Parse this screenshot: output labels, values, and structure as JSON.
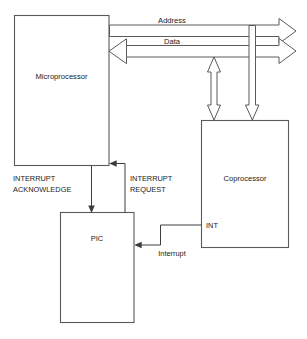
{
  "diagram": {
    "colors": {
      "background": "#ffffff",
      "box_stroke": "#5a5a5a",
      "line_stroke": "#3d3d3d",
      "text": "#1a1a1a"
    },
    "blocks": [
      {
        "id": "microprocessor",
        "label": "Microprocessor"
      },
      {
        "id": "coprocessor",
        "label": "Coprocessor"
      },
      {
        "id": "pic",
        "label": "PIC"
      }
    ],
    "buses": [
      {
        "id": "address-bus",
        "label": "Address",
        "direction": "out"
      },
      {
        "id": "data-bus",
        "label": "Data",
        "direction": "in"
      }
    ],
    "signals": [
      {
        "id": "interrupt-acknowledge",
        "label_line1": "INTERRUPT",
        "label_line2": "ACKNOWLEDGE"
      },
      {
        "id": "interrupt-request",
        "label_line1": "INTERRUPT",
        "label_line2": "REQUEST"
      },
      {
        "id": "coprocessor-int-pin",
        "label": "INT"
      },
      {
        "id": "interrupt-line",
        "label": "Interrupt"
      }
    ]
  }
}
